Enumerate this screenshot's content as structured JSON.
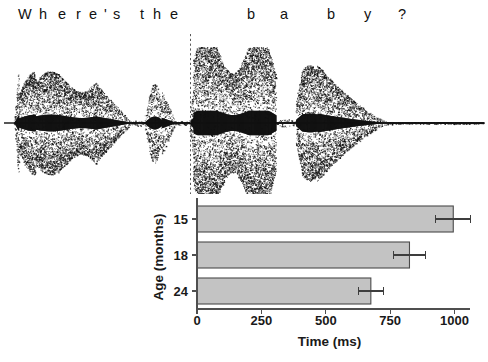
{
  "figure": {
    "width": 488,
    "height": 362,
    "background": "#ffffff"
  },
  "sentence": {
    "full_text": "Where's the baby?",
    "tokens": [
      {
        "text": "W",
        "x": 18
      },
      {
        "text": "h",
        "x": 39
      },
      {
        "text": "e",
        "x": 58
      },
      {
        "text": "r",
        "x": 76
      },
      {
        "text": "e",
        "x": 89
      },
      {
        "text": "'",
        "x": 104
      },
      {
        "text": "s",
        "x": 113
      },
      {
        "text": "t",
        "x": 140
      },
      {
        "text": "h",
        "x": 153
      },
      {
        "text": "e",
        "x": 170
      },
      {
        "text": "b",
        "x": 247
      },
      {
        "text": "a",
        "x": 280
      },
      {
        "text": "b",
        "x": 327
      },
      {
        "text": "y",
        "x": 364
      },
      {
        "text": "?",
        "x": 398
      }
    ]
  },
  "waveform": {
    "label": "speech-waveform",
    "baseline_y": 89,
    "ink_color": "#111111",
    "marker_line": {
      "label": "word-onset-marker",
      "x": 190,
      "style": "dashed",
      "color": "#5a5a5a"
    },
    "segments": [
      {
        "name": "Where's",
        "x_start": 14,
        "x_end": 132,
        "peak_amplitude": 52,
        "density": 0.8
      },
      {
        "name": "silence-1",
        "x_start": 132,
        "x_end": 144,
        "peak_amplitude": 3,
        "density": 0.1
      },
      {
        "name": "the",
        "x_start": 144,
        "x_end": 176,
        "peak_amplitude": 40,
        "density": 0.6
      },
      {
        "name": "silence-2",
        "x_start": 176,
        "x_end": 189,
        "peak_amplitude": 2,
        "density": 0.08
      },
      {
        "name": "ba",
        "x_start": 189,
        "x_end": 276,
        "peak_amplitude": 76,
        "density": 0.72
      },
      {
        "name": "silence-3",
        "x_start": 276,
        "x_end": 296,
        "peak_amplitude": 4,
        "density": 0.1
      },
      {
        "name": "by",
        "x_start": 296,
        "x_end": 393,
        "peak_amplitude": 58,
        "density": 0.78
      },
      {
        "name": "trailing-silence",
        "x_start": 393,
        "x_end": 484,
        "peak_amplitude": 1,
        "density": 0.05
      }
    ]
  },
  "chart_data": {
    "type": "bar",
    "orientation": "horizontal",
    "title": "",
    "xlabel": "Time (ms)",
    "ylabel": "Age (months)",
    "categories": [
      "15",
      "18",
      "24"
    ],
    "values": [
      995,
      825,
      675
    ],
    "errors": [
      68,
      62,
      48
    ],
    "xlim": [
      0,
      1060
    ],
    "xticks": [
      0,
      250,
      500,
      750,
      1000
    ],
    "xtick_labels": [
      "0",
      "250",
      "500",
      "750",
      "1000"
    ],
    "ytick_labels": [
      "15",
      "18",
      "24"
    ],
    "grid": false,
    "legend": null,
    "bar_fill_color": "#c3c3c3",
    "bar_edge_color": "#4a4a4a",
    "error_bar_color": "#3d3d3d",
    "axis_color": "#4f4f4f"
  },
  "geometry": {
    "plot_left_x": 197,
    "plot_right_x": 470,
    "x_value_at_left": 0,
    "x_value_at_right": 1060,
    "bars": [
      {
        "category": "15",
        "top_y": 12,
        "height": 26
      },
      {
        "category": "18",
        "top_y": 48,
        "height": 26
      },
      {
        "category": "24",
        "top_y": 84,
        "height": 26
      }
    ],
    "axis_baseline_y": 115,
    "tick_label_y": 131,
    "xlabel_y": 152,
    "ylabel_x": 163,
    "ylabel_y": 63
  }
}
